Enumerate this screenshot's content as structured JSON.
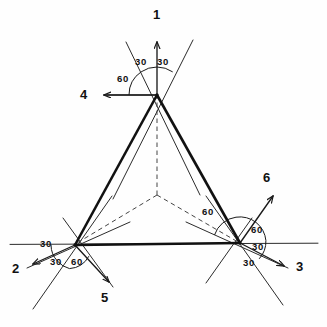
{
  "figure": {
    "background": "#fefefe",
    "stroke_main": "#1a1a1a",
    "stroke_thin": "#2b2b2b",
    "stroke_dashed": "#444444",
    "width": 327,
    "height": 327
  },
  "geometry": {
    "apex": {
      "x": 157,
      "y": 95
    },
    "left_vertex": {
      "x": 75,
      "y": 245
    },
    "right_vertex": {
      "x": 240,
      "y": 243
    },
    "centroid": {
      "x": 157,
      "y": 195
    },
    "baseline_left_x": 10,
    "baseline_right_x": 318,
    "baseline_y": 244
  },
  "rays": [
    {
      "id": "ray-1",
      "label": "1",
      "x": 157,
      "y": 14,
      "anchor_x": 157,
      "anchor_y": 95,
      "tip_x": 157,
      "tip_y": 42
    },
    {
      "id": "ray-2",
      "label": "2",
      "x": 12,
      "y": 268,
      "anchor_x": 75,
      "anchor_y": 245,
      "tip_x": 34,
      "tip_y": 265
    },
    {
      "id": "ray-3",
      "label": "3",
      "x": 298,
      "y": 266,
      "anchor_x": 240,
      "anchor_y": 243,
      "tip_x": 283,
      "tip_y": 266
    },
    {
      "id": "ray-4",
      "label": "4",
      "x": 80,
      "y": 88,
      "anchor_x": 157,
      "anchor_y": 95,
      "tip_x": 104,
      "tip_y": 95
    },
    {
      "id": "ray-5",
      "label": "5",
      "x": 101,
      "y": 292,
      "anchor_x": 75,
      "anchor_y": 245,
      "tip_x": 110,
      "tip_y": 283
    },
    {
      "id": "ray-6",
      "label": "6",
      "x": 263,
      "y": 172,
      "anchor_x": 240,
      "anchor_y": 243,
      "tip_x": 272,
      "tip_y": 197
    }
  ],
  "angle_labels": [
    {
      "id": "apex-left-30",
      "text": "30",
      "x": 137,
      "y": 59,
      "vertex": "apex"
    },
    {
      "id": "apex-right-30",
      "text": "30",
      "x": 159,
      "y": 59,
      "vertex": "apex"
    },
    {
      "id": "apex-60",
      "text": "60",
      "x": 120,
      "y": 76,
      "vertex": "apex"
    },
    {
      "id": "left-upper-30",
      "text": "30",
      "x": 42,
      "y": 240,
      "vertex": "left"
    },
    {
      "id": "left-lower-30",
      "text": "30",
      "x": 52,
      "y": 256,
      "vertex": "left"
    },
    {
      "id": "left-60",
      "text": "60",
      "x": 73,
      "y": 257,
      "vertex": "left"
    },
    {
      "id": "right-upper-60",
      "text": "60",
      "x": 204,
      "y": 209,
      "vertex": "right"
    },
    {
      "id": "right-mid-60",
      "text": "60",
      "x": 252,
      "y": 227,
      "vertex": "right"
    },
    {
      "id": "right-upper-30",
      "text": "30",
      "x": 253,
      "y": 243,
      "vertex": "right"
    },
    {
      "id": "right-lower-30",
      "text": "30",
      "x": 245,
      "y": 258,
      "vertex": "right"
    }
  ],
  "arcs": {
    "apex_radius": 28,
    "left_radius": 24,
    "right_radius": 26
  }
}
